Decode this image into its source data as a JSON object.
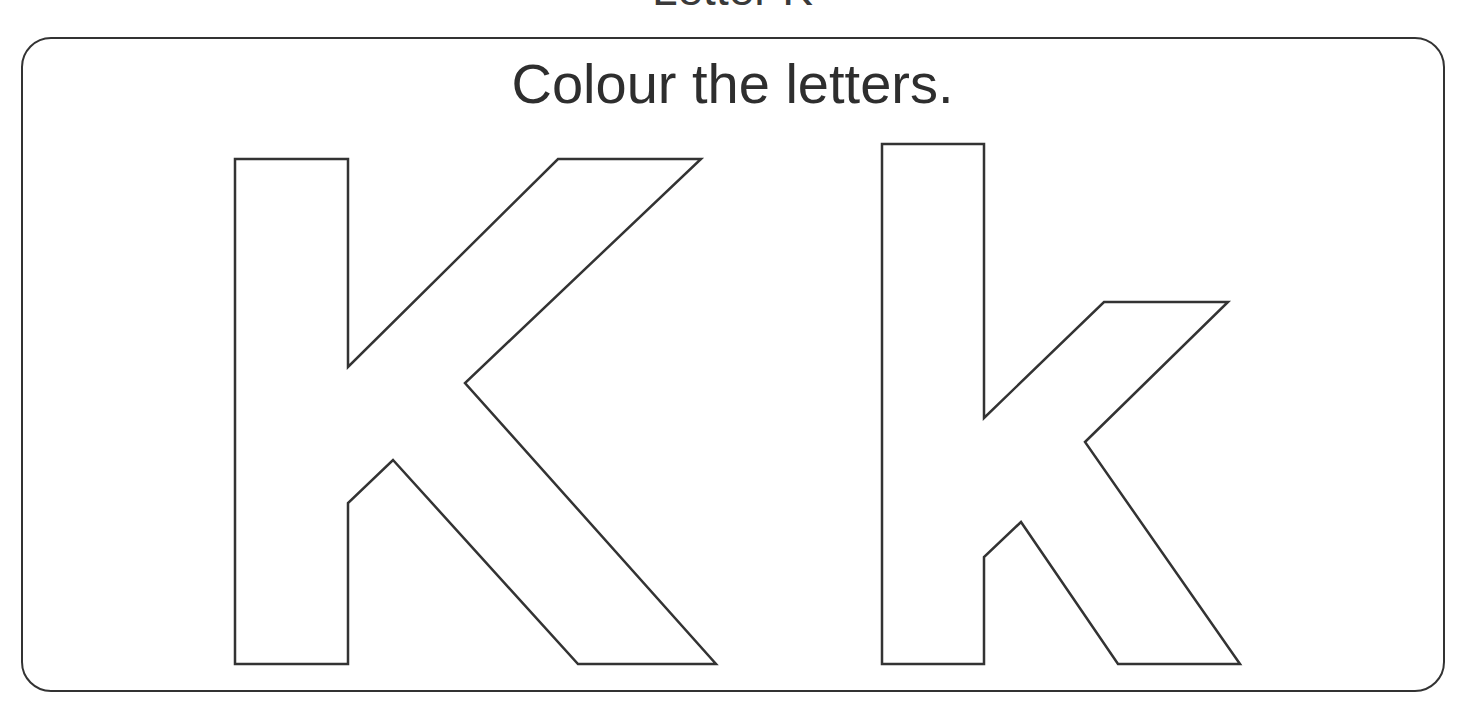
{
  "worksheet": {
    "heading": "Letter K",
    "instruction": "Colour the letters.",
    "letters": [
      {
        "name": "uppercase-k",
        "char": "K"
      },
      {
        "name": "lowercase-k",
        "char": "k"
      }
    ],
    "colors": {
      "outline": "#333333",
      "text": "#2e2e2e",
      "background": "#ffffff"
    }
  }
}
